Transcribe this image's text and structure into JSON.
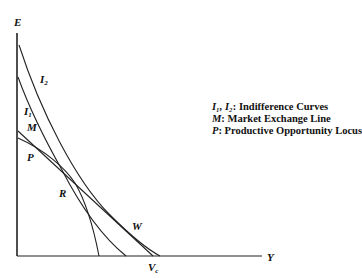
{
  "diagram": {
    "axes": {
      "vertical_label": "E",
      "horizontal_label": "Y",
      "intercept_label": "V",
      "intercept_subscript": "c"
    },
    "curve_labels": {
      "I2": {
        "main": "I",
        "sub": "2"
      },
      "I1": {
        "main": "I",
        "sub": "1"
      },
      "M": "M",
      "P": "P",
      "R": "R",
      "W": "W"
    },
    "legend": [
      {
        "symbol": "I₁, I₂",
        "separator": ": ",
        "text": "Indifference Curves"
      },
      {
        "symbol": "M",
        "separator": ": ",
        "text": "Market Exchange Line"
      },
      {
        "symbol": "P",
        "separator": ": ",
        "text": "Productive Opportunity Locus"
      }
    ],
    "colors": {
      "line": "#222222",
      "background": "#ffffff"
    }
  }
}
